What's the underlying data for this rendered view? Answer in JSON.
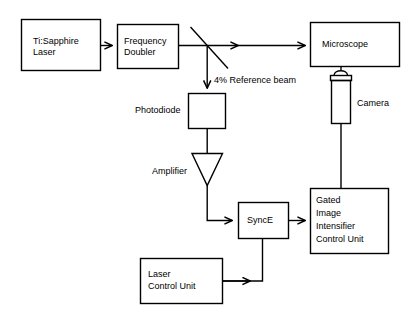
{
  "diagram": {
    "stroke_color": "#000000",
    "background_color": "#ffffff",
    "blocks": [
      {
        "id": "ti-sapphire-laser",
        "label": "Ti:Sapphire\nLaser",
        "shape": "rectangle"
      },
      {
        "id": "frequency-doubler",
        "label": "Frequency\nDoubler",
        "shape": "rectangle"
      },
      {
        "id": "microscope",
        "label": "Microscope",
        "shape": "rectangle"
      },
      {
        "id": "photodiode-box",
        "label": "",
        "shape": "rectangle"
      },
      {
        "id": "amplifier-triangle",
        "label": "",
        "shape": "triangle"
      },
      {
        "id": "sync-e",
        "label": "SyncE",
        "shape": "rectangle"
      },
      {
        "id": "gated-image-intensifier-control-unit",
        "label": "Gated\nImage\nIntensifier\nControl Unit",
        "shape": "rectangle"
      },
      {
        "id": "laser-control-unit",
        "label": "Laser\nControl Unit",
        "shape": "rectangle"
      },
      {
        "id": "camera",
        "label": "",
        "shape": "camera"
      },
      {
        "id": "beamsplitter",
        "label": "",
        "shape": "diagonal-line"
      }
    ],
    "labels": {
      "laser": "Ti:Sapphire\nLaser",
      "laser_line1": "Ti:Sapphire",
      "laser_line2": "Laser",
      "doubler_line1": "Frequency",
      "doubler_line2": "Doubler",
      "microscope": "Microscope",
      "reference_beam": "4% Reference beam",
      "photodiode": "Photodiode",
      "amplifier": "Amplifier",
      "sync_e": "SyncE",
      "camera": "Camera",
      "giicu_line1": "Gated",
      "giicu_line2": "Image",
      "giicu_line3": "Intensifier",
      "giicu_line4": "Control Unit",
      "lcu_line1": "Laser",
      "lcu_line2": "Control Unit"
    },
    "connections": [
      {
        "from": "ti-sapphire-laser",
        "to": "frequency-doubler",
        "arrow": true
      },
      {
        "from": "frequency-doubler",
        "to": "microscope",
        "arrow": true,
        "via": "beamsplitter"
      },
      {
        "from": "beamsplitter",
        "to": "photodiode-box",
        "arrow": true,
        "label": "4% Reference beam"
      },
      {
        "from": "photodiode-box",
        "to": "amplifier-triangle",
        "arrow": false
      },
      {
        "from": "amplifier-triangle",
        "to": "sync-e",
        "arrow": true
      },
      {
        "from": "sync-e",
        "to": "gated-image-intensifier-control-unit",
        "arrow": true
      },
      {
        "from": "laser-control-unit",
        "to": "sync-e",
        "arrow": true
      },
      {
        "from": "camera",
        "to": "gated-image-intensifier-control-unit",
        "arrow": false
      },
      {
        "from": "microscope",
        "to": "camera",
        "arrow": false
      }
    ]
  }
}
